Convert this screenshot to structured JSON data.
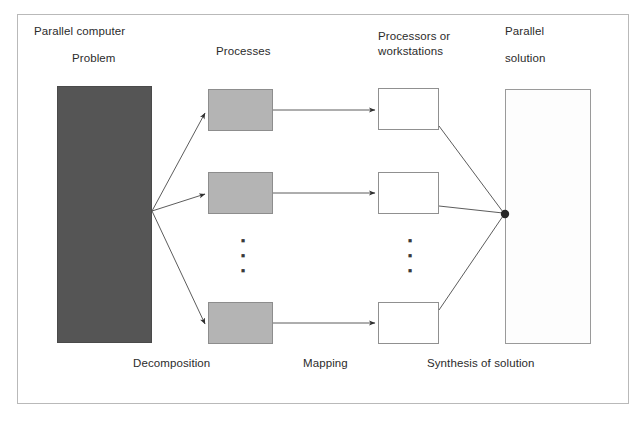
{
  "diagram": {
    "title_labels": {
      "parallel_computer": "Parallel computer",
      "problem": "Problem",
      "processes": "Processes",
      "processors_line1": "Processors or",
      "processors_line2": "workstations",
      "parallel_line1": "Parallel",
      "parallel_line2": "solution"
    },
    "stage_labels": {
      "decomposition": "Decomposition",
      "mapping": "Mapping",
      "synthesis": "Synthesis of solution"
    },
    "ellipsis": {
      "dot": "▪",
      "count": 3
    },
    "nodes": {
      "problem_box": "problem",
      "process_boxes": [
        "process-1",
        "process-2",
        "process-n"
      ],
      "processor_boxes": [
        "processor-1",
        "processor-2",
        "processor-n"
      ],
      "solution_box": "parallel-solution"
    },
    "colors": {
      "problem_fill": "#555555",
      "process_fill": "#b4b4b4",
      "processor_fill": "#ffffff",
      "solution_fill": "#fdfdfd",
      "frame_border": "#b9b9b9",
      "line": "#4a4a4a",
      "text": "#2b2b2b"
    }
  }
}
